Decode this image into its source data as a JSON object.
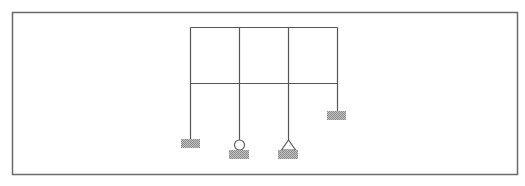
{
  "diagram": {
    "type": "structural-frame",
    "colors": {
      "background": "#ffffff",
      "border": "#6a6a6a",
      "member": "#555555",
      "hatch_fill": "#b8b8b8",
      "hatch_dark": "#8a8a8a"
    },
    "border": {
      "x": 12,
      "y": 12,
      "width": 505,
      "height": 162
    },
    "columns_x": [
      190,
      239,
      288,
      337
    ],
    "beams_y": [
      27,
      83
    ],
    "members": [
      {
        "id": "top-beam",
        "kind": "beam",
        "x1": 190,
        "y1": 27,
        "x2": 337,
        "y2": 27
      },
      {
        "id": "middle-beam",
        "kind": "beam",
        "x1": 190,
        "y1": 83,
        "x2": 337,
        "y2": 83
      },
      {
        "id": "column-1",
        "kind": "column",
        "x1": 190,
        "y1": 27,
        "x2": 190,
        "y2": 139
      },
      {
        "id": "column-2",
        "kind": "column",
        "x1": 239,
        "y1": 27,
        "x2": 239,
        "y2": 140
      },
      {
        "id": "column-3",
        "kind": "column",
        "x1": 288,
        "y1": 27,
        "x2": 288,
        "y2": 140
      },
      {
        "id": "column-4",
        "kind": "column",
        "x1": 337,
        "y1": 27,
        "x2": 337,
        "y2": 111
      }
    ],
    "supports": [
      {
        "id": "support-1",
        "type": "fixed",
        "column": 1,
        "x": 181,
        "y": 139,
        "width": 19,
        "height": 9
      },
      {
        "id": "support-2",
        "type": "roller",
        "column": 2,
        "cx": 239,
        "cy": 145,
        "r": 5,
        "base": {
          "x": 229,
          "y": 150,
          "width": 20,
          "height": 9
        }
      },
      {
        "id": "support-3",
        "type": "pin",
        "column": 3,
        "apex": [
          288,
          140
        ],
        "left": [
          281,
          150
        ],
        "right": [
          295,
          150
        ],
        "base": {
          "x": 278,
          "y": 150,
          "width": 20,
          "height": 9
        }
      },
      {
        "id": "support-4",
        "type": "fixed",
        "column": 4,
        "x": 327,
        "y": 111,
        "width": 19,
        "height": 9
      }
    ]
  }
}
